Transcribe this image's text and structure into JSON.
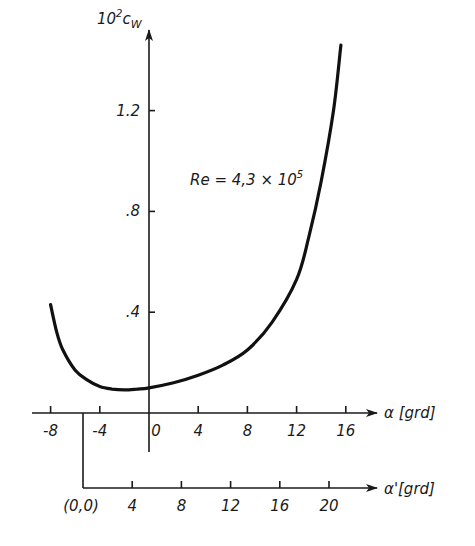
{
  "chart_data": {
    "type": "line",
    "title": "",
    "annotation": "Re = 4,3 × 10⁵",
    "xlabel": "α [grd]",
    "xlabel_secondary": "α' [grd]",
    "ylabel": "10²c_W",
    "xlim": [
      -9,
      17
    ],
    "ylim": [
      0,
      1.5
    ],
    "x_ticks": [
      "-8",
      "-4",
      "0",
      "4",
      "8",
      "12",
      "16"
    ],
    "x_secondary_ticks": [
      "(0,0)",
      "4",
      "8",
      "12",
      "16",
      "20"
    ],
    "x_secondary_offset_note": "α' = α + 6 (origin (0,0) at α = -6)",
    "y_ticks": [
      ".4",
      ".8",
      "1.2"
    ],
    "grid": false,
    "legend": null,
    "series": [
      {
        "name": "c_W (Re = 4,3 × 10⁵)",
        "x": [
          -8,
          -7.5,
          -7,
          -6,
          -5,
          -4,
          -3,
          -2,
          -1,
          0,
          2,
          4,
          6,
          8,
          10,
          12,
          13,
          14,
          15,
          15.6
        ],
        "values": [
          0.43,
          0.32,
          0.25,
          0.17,
          0.13,
          0.105,
          0.095,
          0.092,
          0.095,
          0.1,
          0.12,
          0.15,
          0.19,
          0.25,
          0.36,
          0.53,
          0.7,
          0.92,
          1.2,
          1.46
        ]
      }
    ]
  },
  "labels": {
    "ylabel_main": "10",
    "ylabel_sup": "2",
    "ylabel_rest": "c",
    "ylabel_sub": "W",
    "xlabel": "α [grd]",
    "xlabel_secondary": "α'[grd]",
    "annotation_main": "Re = 4,3 × 10",
    "annotation_sup": "5",
    "y_ticks": [
      ".4",
      ".8",
      "1.2"
    ],
    "x_ticks": [
      "-8",
      "-4",
      "0",
      "4",
      "8",
      "12",
      "16"
    ],
    "x2_ticks": [
      "(0,0)",
      "4",
      "8",
      "12",
      "16",
      "20"
    ]
  }
}
